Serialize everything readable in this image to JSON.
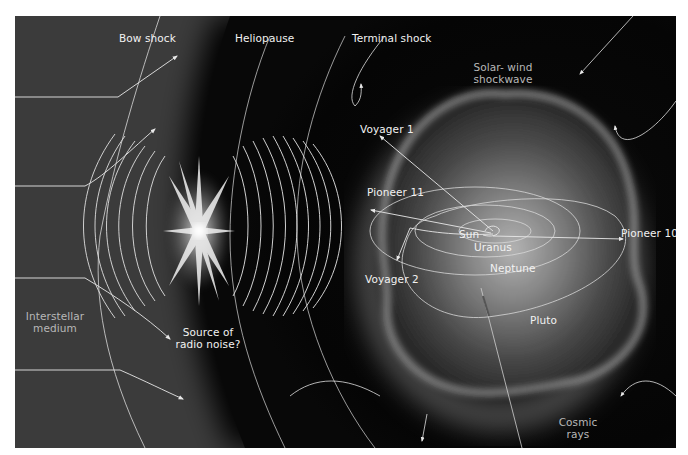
{
  "diagram": {
    "colors": {
      "interstellar": "#3a3a3a",
      "heliosphere": "#050505",
      "glow": "#9a9a9a",
      "lines": "#e8e8e8",
      "label": "#f2f2f2"
    },
    "labels": {
      "bow_shock": "Bow shock",
      "heliopause": "Heliopause",
      "terminal_shock": "Terminal shock",
      "solar_wind_1": "Solar- wind",
      "solar_wind_2": "shockwave",
      "voyager1": "Voyager 1",
      "pioneer11": "Pioneer 11",
      "sun": "Sun",
      "uranus": "Uranus",
      "pioneer10": "Pioneer 10",
      "neptune": "Neptune",
      "voyager2": "Voyager 2",
      "pluto": "Pluto",
      "interstellar_1": "Interstellar",
      "interstellar_2": "medium",
      "radio_1": "Source of",
      "radio_2": "radio noise?",
      "cosmic_1": "Cosmic",
      "cosmic_2": "rays"
    },
    "regions": [
      "Interstellar medium",
      "Bow shock",
      "Heliopause",
      "Terminal shock",
      "Solar-wind shockwave"
    ],
    "spacecraft": [
      "Voyager 1",
      "Pioneer 11",
      "Pioneer 10",
      "Voyager 2"
    ],
    "bodies": [
      "Sun",
      "Uranus",
      "Neptune",
      "Pluto"
    ]
  }
}
